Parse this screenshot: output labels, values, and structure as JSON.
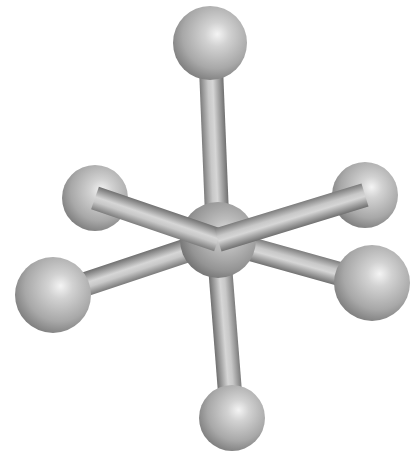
{
  "figure": {
    "description": "Octahedral ball-and-stick molecular model (central atom with six ligands)",
    "geometry": "octahedral",
    "background": "#ffffff",
    "atom_color": "#b4b4b4",
    "bond_color": "#9a9a9a",
    "central_atom": {
      "cx": 218,
      "cy": 240,
      "r": 38
    },
    "ligands": [
      {
        "id": "top",
        "cx": 210,
        "cy": 43,
        "r": 37,
        "bond_front": false
      },
      {
        "id": "upper-left",
        "cx": 95,
        "cy": 198,
        "r": 33,
        "bond_front": true
      },
      {
        "id": "upper-right",
        "cx": 365,
        "cy": 195,
        "r": 33,
        "bond_front": true
      },
      {
        "id": "lower-left",
        "cx": 53,
        "cy": 295,
        "r": 38,
        "bond_front": false
      },
      {
        "id": "lower-right",
        "cx": 372,
        "cy": 283,
        "r": 38,
        "bond_front": false
      },
      {
        "id": "bottom",
        "cx": 232,
        "cy": 418,
        "r": 33,
        "bond_front": false
      }
    ],
    "bond_width": 24
  }
}
